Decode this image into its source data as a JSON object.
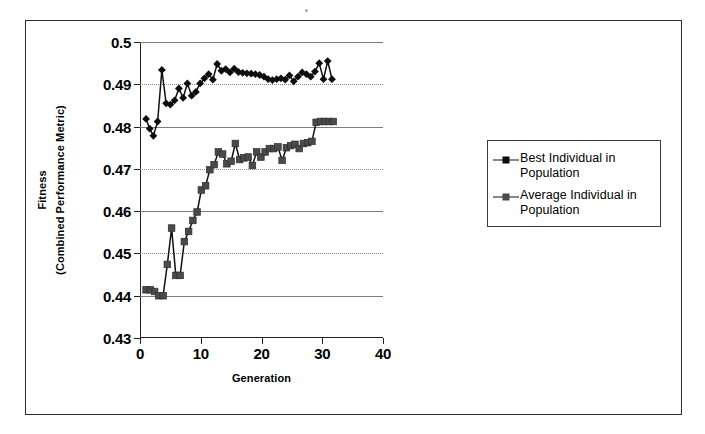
{
  "figure": {
    "background": "#ffffff",
    "border_color": "#2b2b2b"
  },
  "legend": {
    "position": "right",
    "entries": [
      {
        "label": "Best Individual in Population",
        "marker": "diamond-marker",
        "color": "#0d0d0d"
      },
      {
        "label": "Average Individual in Population",
        "marker": "square-marker",
        "color": "#4a4a4a"
      }
    ]
  },
  "axis": {
    "y_title_line1": "Fitness",
    "y_title_line2": "(Combined Performance Metric)",
    "x_title": "Generation"
  },
  "chart_data": {
    "type": "line",
    "title": "",
    "subtitle": "",
    "xlabel": "Generation",
    "ylabel": "Fitness (Combined Performance Metric)",
    "xlim": [
      0,
      40
    ],
    "ylim": [
      0.43,
      0.5
    ],
    "xticks": [
      0,
      10,
      20,
      30,
      40
    ],
    "xticklabels": [
      "0",
      "10",
      "20",
      "30",
      "40"
    ],
    "yticks": [
      0.43,
      0.44,
      0.45,
      0.46,
      0.47,
      0.48,
      0.49,
      0.5
    ],
    "yticklabels": [
      "0.43",
      "0.44",
      "0.45",
      "0.46",
      "0.47",
      "0.48",
      "0.49",
      "0.5"
    ],
    "grid": true,
    "grid_axis": "y",
    "legend_position": "right-outside",
    "markers": true,
    "x": [
      1,
      2,
      3,
      4,
      5,
      6,
      7,
      8,
      9,
      10,
      11,
      12,
      13,
      14,
      15,
      16,
      17,
      18,
      19,
      20,
      21,
      22,
      23,
      24,
      25,
      26,
      27,
      28,
      29,
      30,
      31,
      32
    ],
    "series": [
      {
        "name": "Best Individual in Population",
        "marker": "diamond",
        "color": "#0d0d0d",
        "x": [
          1,
          1.6,
          2.2,
          2.9,
          3.6,
          4.3,
          5.0,
          5.7,
          6.4,
          7.1,
          7.8,
          8.5,
          9.2,
          9.9,
          10.6,
          11.3,
          12.0,
          12.7,
          13.4,
          14.1,
          14.8,
          15.5,
          16.2,
          16.9,
          17.6,
          18.3,
          19.0,
          19.7,
          20.4,
          21.1,
          21.8,
          22.5,
          23.2,
          23.9,
          24.6,
          25.3,
          26.0,
          26.7,
          27.4,
          28.1,
          28.8,
          29.5,
          30.2,
          30.9,
          31.6
        ],
        "values": [
          0.4818,
          0.4795,
          0.4778,
          0.4812,
          0.4934,
          0.4855,
          0.4852,
          0.4862,
          0.489,
          0.4868,
          0.4902,
          0.4873,
          0.4882,
          0.4902,
          0.4914,
          0.4924,
          0.4911,
          0.4948,
          0.4932,
          0.4936,
          0.4928,
          0.4937,
          0.4929,
          0.4927,
          0.4926,
          0.4925,
          0.4924,
          0.4922,
          0.4918,
          0.4912,
          0.491,
          0.4912,
          0.4914,
          0.4911,
          0.4921,
          0.4907,
          0.4918,
          0.4928,
          0.4924,
          0.4918,
          0.493,
          0.495,
          0.4912,
          0.4955,
          0.4912
        ]
      },
      {
        "name": "Average Individual in Population",
        "marker": "square",
        "color": "#4a4a4a",
        "x": [
          1,
          1.7,
          2.4,
          3.1,
          3.8,
          4.5,
          5.2,
          5.9,
          6.6,
          7.3,
          8.0,
          8.7,
          9.4,
          10.1,
          10.8,
          11.5,
          12.2,
          12.9,
          13.6,
          14.3,
          15.0,
          15.7,
          16.4,
          17.1,
          17.8,
          18.5,
          19.2,
          19.9,
          20.6,
          21.3,
          22.0,
          22.7,
          23.4,
          24.1,
          24.8,
          25.5,
          26.2,
          26.9,
          27.6,
          28.3,
          29.0,
          29.7,
          30.4,
          31.1,
          31.8
        ],
        "values": [
          0.4414,
          0.4414,
          0.441,
          0.44,
          0.44,
          0.4474,
          0.456,
          0.4448,
          0.4448,
          0.4528,
          0.4552,
          0.4578,
          0.4598,
          0.465,
          0.466,
          0.4698,
          0.471,
          0.474,
          0.4735,
          0.4712,
          0.4718,
          0.476,
          0.4722,
          0.4726,
          0.4728,
          0.4708,
          0.474,
          0.4728,
          0.474,
          0.4748,
          0.4748,
          0.4752,
          0.472,
          0.475,
          0.4755,
          0.4758,
          0.4748,
          0.476,
          0.4762,
          0.4765,
          0.481,
          0.4812,
          0.4812,
          0.4812,
          0.4812
        ]
      }
    ]
  }
}
